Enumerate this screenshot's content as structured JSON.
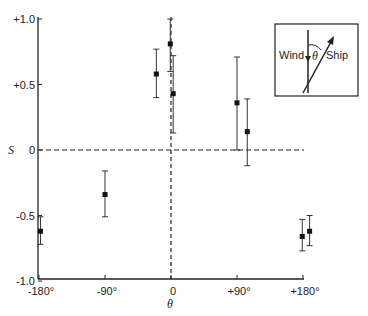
{
  "chart_data": {
    "type": "scatter",
    "title": "",
    "xlabel": "θ",
    "ylabel": "S",
    "xlim": [
      -180,
      195
    ],
    "ylim": [
      -1.0,
      1.0
    ],
    "grid": false,
    "x_ticks": [
      {
        "value": -180,
        "label": "-180°"
      },
      {
        "value": -90,
        "label": "-90°"
      },
      {
        "value": 0,
        "label": "0"
      },
      {
        "value": 90,
        "label": "+90°"
      },
      {
        "value": 180,
        "label": "+180°"
      }
    ],
    "y_ticks": [
      {
        "value": 1.0,
        "label": "+1.0"
      },
      {
        "value": 0.5,
        "label": "+0.5"
      },
      {
        "value": 0,
        "label": "0"
      },
      {
        "value": -0.5,
        "label": "-0.5"
      },
      {
        "value": -1.0,
        "label": "-1.0"
      }
    ],
    "reference_lines": [
      {
        "orientation": "horizontal",
        "value": 0,
        "style": "dashed"
      },
      {
        "orientation": "vertical",
        "value": 0,
        "style": "dashed"
      }
    ],
    "series": [
      {
        "name": "S vs θ",
        "points": [
          {
            "x": -178,
            "y": -0.62,
            "err_low": -0.72,
            "err_high": -0.51
          },
          {
            "x": -90,
            "y": -0.34,
            "err_low": -0.51,
            "err_high": -0.16
          },
          {
            "x": -20,
            "y": 0.58,
            "err_low": 0.4,
            "err_high": 0.77
          },
          {
            "x": -1,
            "y": 0.81,
            "err_low": 0.6,
            "err_high": 1.0
          },
          {
            "x": 3,
            "y": 0.43,
            "err_low": 0.13,
            "err_high": 0.72
          },
          {
            "x": 90,
            "y": 0.36,
            "err_low": 0.0,
            "err_high": 0.71
          },
          {
            "x": 104,
            "y": 0.14,
            "err_low": -0.12,
            "err_high": 0.39
          },
          {
            "x": 179,
            "y": -0.66,
            "err_low": -0.77,
            "err_high": -0.53
          },
          {
            "x": 189,
            "y": -0.62,
            "err_low": -0.73,
            "err_high": -0.5
          }
        ]
      }
    ],
    "inset": {
      "wind_label": "Wind",
      "ship_label": "Ship",
      "angle_label": "θ"
    }
  }
}
